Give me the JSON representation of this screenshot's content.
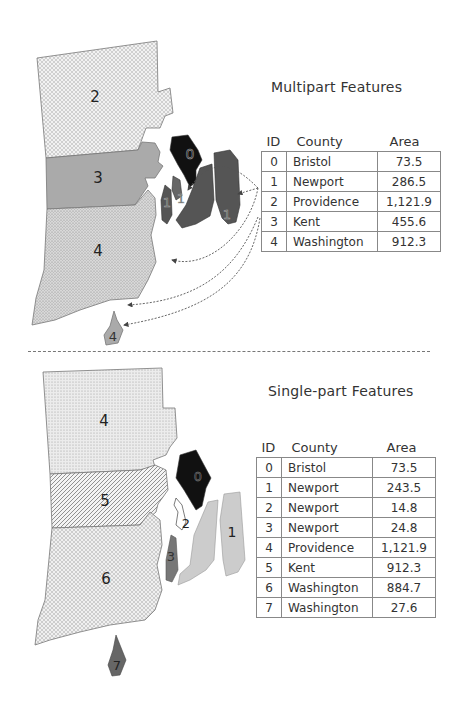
{
  "multipart": {
    "title": "Multipart Features",
    "columns": [
      "ID",
      "County",
      "Area"
    ],
    "rows": [
      {
        "id": "0",
        "county": "Bristol",
        "area": "73.5"
      },
      {
        "id": "1",
        "county": "Newport",
        "area": "286.5"
      },
      {
        "id": "2",
        "county": "Providence",
        "area": "1,121.9"
      },
      {
        "id": "3",
        "county": "Kent",
        "area": "455.6"
      },
      {
        "id": "4",
        "county": "Washington",
        "area": "912.3"
      }
    ],
    "map_labels": {
      "providence": "2",
      "kent": "3",
      "washington": "4",
      "bristol": "0",
      "newport": "1",
      "block_island": "4"
    }
  },
  "singlepart": {
    "title": "Single-part Features",
    "columns": [
      "ID",
      "County",
      "Area"
    ],
    "rows": [
      {
        "id": "0",
        "county": "Bristol",
        "area": "73.5"
      },
      {
        "id": "1",
        "county": "Newport",
        "area": "243.5"
      },
      {
        "id": "2",
        "county": "Newport",
        "area": "14.8"
      },
      {
        "id": "3",
        "county": "Newport",
        "area": "24.8"
      },
      {
        "id": "4",
        "county": "Providence",
        "area": "1,121.9"
      },
      {
        "id": "5",
        "county": "Kent",
        "area": "912.3"
      },
      {
        "id": "6",
        "county": "Washington",
        "area": "884.7"
      },
      {
        "id": "7",
        "county": "Washington",
        "area": "27.6"
      }
    ],
    "map_labels": {
      "providence": "4",
      "kent": "5",
      "washington": "6",
      "bristol": "0",
      "aquidneck": "1",
      "prudence": "2",
      "conanicut": "3",
      "block_island": "7"
    }
  },
  "colors": {
    "bristol": "#111111",
    "newport_multi": "#555555",
    "kent_multi": "#aaaaaa",
    "newport_single_1": "#cccccc",
    "newport_single_3": "#777777",
    "block_island_single": "#666666"
  }
}
